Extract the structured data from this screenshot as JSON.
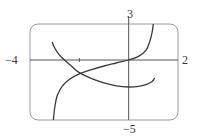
{
  "chart_data": {
    "type": "line",
    "title": "",
    "xlabel": "",
    "ylabel": "",
    "xlim": [
      -4,
      2
    ],
    "ylim": [
      -5,
      3
    ],
    "grid": false,
    "legend": null,
    "tick_labels": {
      "x_min": "−4",
      "x_max": "2",
      "y_max": "3",
      "y_min": "−5"
    },
    "x_ticks": [
      -2
    ],
    "series": [
      {
        "name": "increasing curve",
        "x": [
          -3.05,
          -3.0,
          -2.9,
          -2.7,
          -2.4,
          -2.0,
          -1.5,
          -1.0,
          -0.5,
          0.0,
          0.4,
          0.7,
          0.85,
          0.95,
          1.0
        ],
        "y": [
          -5.0,
          -4.0,
          -3.0,
          -2.2,
          -1.6,
          -1.15,
          -0.8,
          -0.5,
          -0.25,
          0.0,
          0.3,
          0.8,
          1.5,
          2.3,
          3.0
        ]
      },
      {
        "name": "decreasing curve",
        "x": [
          -3.1,
          -3.0,
          -2.8,
          -2.6,
          -2.3,
          -2.0,
          -1.5,
          -1.0,
          -0.5,
          0.0,
          0.4,
          0.7,
          0.95,
          1.05
        ],
        "y": [
          1.5,
          1.0,
          0.4,
          0.0,
          -0.55,
          -1.05,
          -1.55,
          -1.9,
          -2.15,
          -2.25,
          -2.2,
          -2.05,
          -1.8,
          -1.5
        ]
      }
    ],
    "intersection_approx": {
      "x": -2.0,
      "y": -1.15
    }
  },
  "style": {
    "axis_color": "#555555",
    "curve_color": "#3a3a3a",
    "frame_color": "#9a9a9a",
    "background": "#ffffff"
  },
  "frame": {
    "x0": 30,
    "y0": 24,
    "x1": 178,
    "y1": 120,
    "radius": 8
  }
}
